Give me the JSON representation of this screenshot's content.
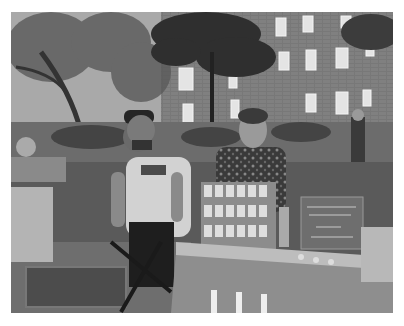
{
  "image": {
    "type": "photograph",
    "color_mode": "grayscale",
    "border_color": "#ffffff",
    "description": "Outdoor street fair / market in a courtyard in front of a brick apartment building with trees; a man in a cap and graphic t-shirt and a woman in a floral top stand behind a vendor table displaying cards on a tiered stand, with a chalkboard sign on the right",
    "sign_text": "illegible chalkboard sign"
  },
  "palette": {
    "sky": "#d8d8d8",
    "building": "#7a7a7a",
    "window": "#e6e6e6",
    "tree": "#3a3a3a",
    "ground": "#5e5e5e",
    "table": "#9c9c9c",
    "shirt": "#d4d4d4",
    "dark": "#222222"
  }
}
